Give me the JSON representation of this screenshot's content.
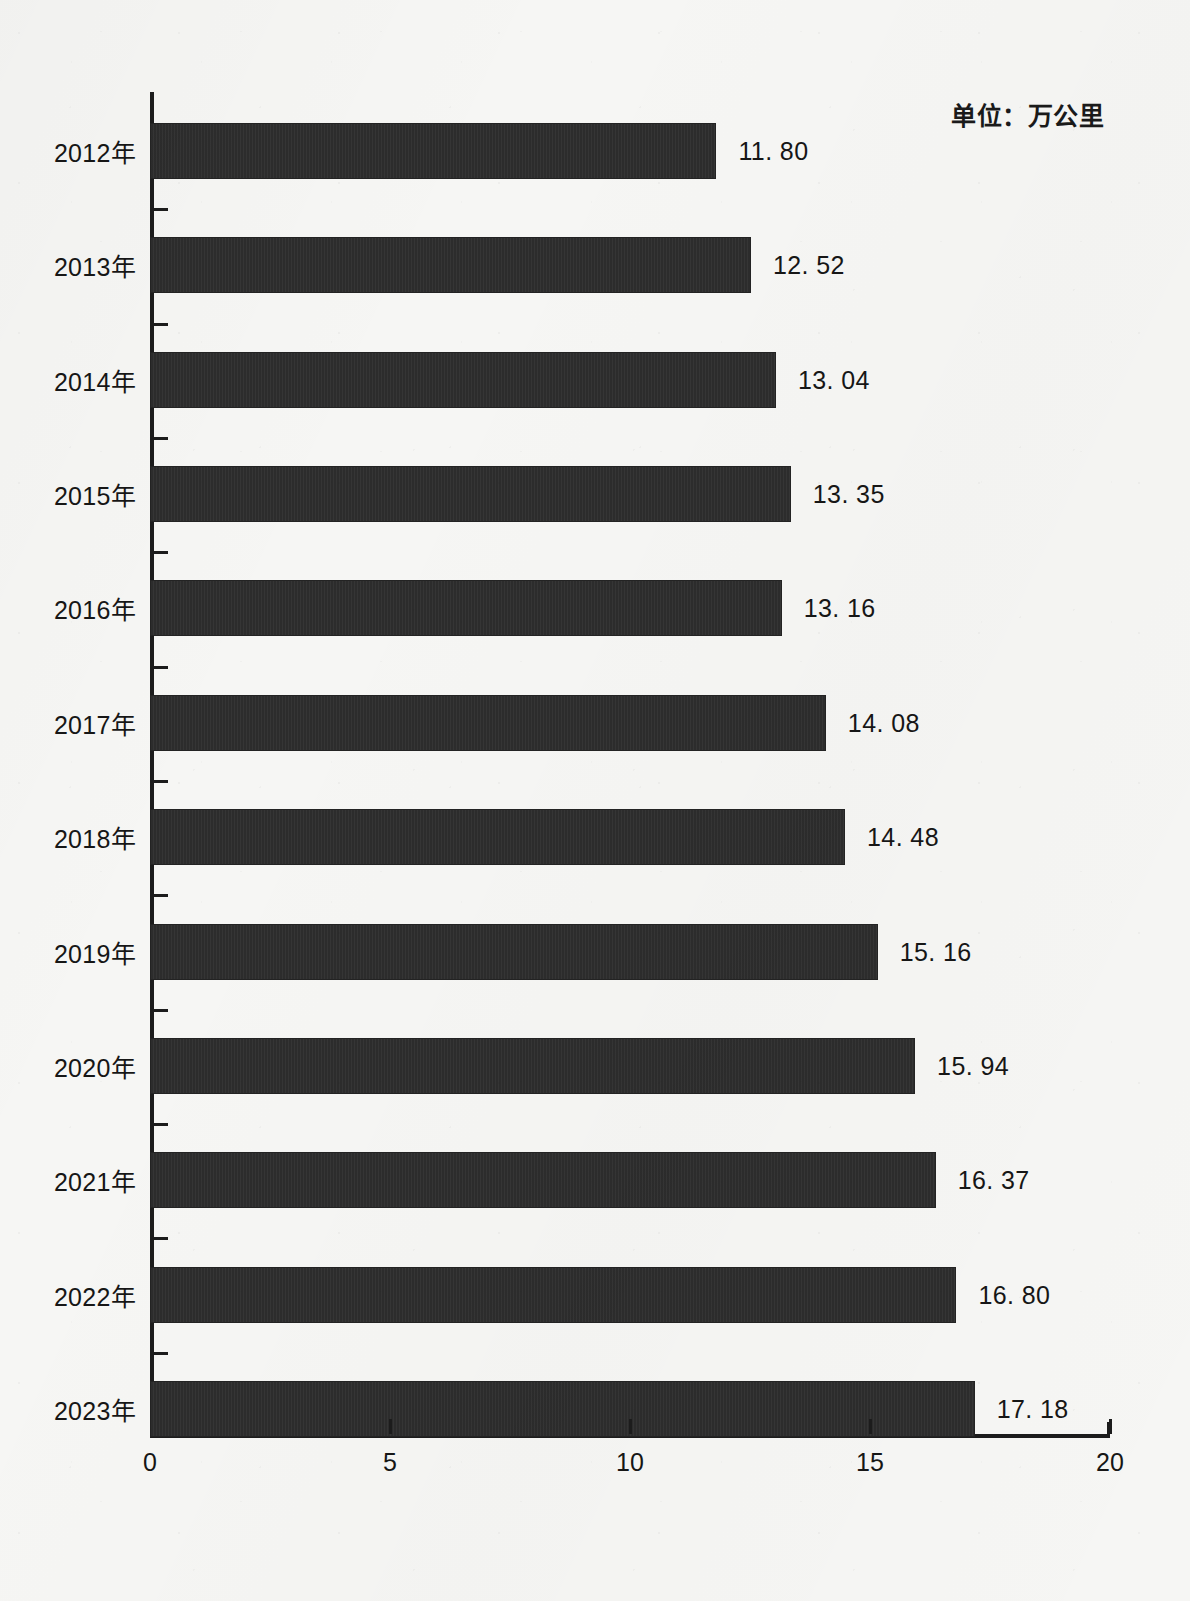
{
  "unit_caption": "单位：万公里",
  "axis": {
    "x_ticks": [
      "0",
      "5",
      "10",
      "15",
      "20"
    ],
    "x_min": 0,
    "x_max": 20
  },
  "chart_data": {
    "type": "bar",
    "orientation": "horizontal",
    "title": "",
    "subtitle": "",
    "xlabel": "",
    "ylabel": "",
    "unit": "万公里",
    "xlim": [
      0,
      20
    ],
    "xticks": [
      0,
      5,
      10,
      15,
      20
    ],
    "grid": false,
    "legend": null,
    "bar_color": "#2c2c2c",
    "background_color": "#f6f6f4",
    "categories": [
      "2012年",
      "2013年",
      "2014年",
      "2015年",
      "2016年",
      "2017年",
      "2018年",
      "2019年",
      "2020年",
      "2021年",
      "2022年",
      "2023年"
    ],
    "values": [
      11.8,
      12.52,
      13.04,
      13.35,
      13.16,
      14.08,
      14.48,
      15.16,
      15.94,
      16.37,
      16.8,
      17.18
    ],
    "labels": [
      "11. 80",
      "12. 52",
      "13. 04",
      "13. 35",
      "13. 16",
      "14. 08",
      "14. 48",
      "15. 16",
      "15. 94",
      "16. 37",
      "16. 80",
      "17. 18"
    ]
  }
}
